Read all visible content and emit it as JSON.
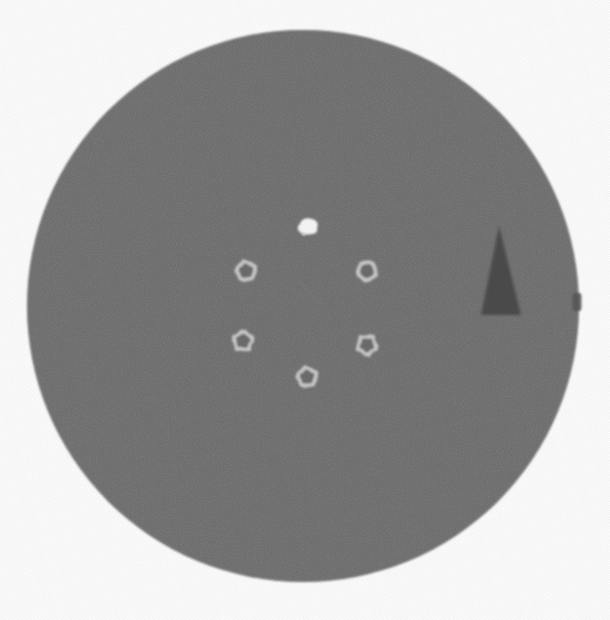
{
  "image": {
    "kind": "medical-scan-slice",
    "modality_hint": "axial-grayscale-slice",
    "width": 610,
    "height": 620,
    "background_color": "#fcfcfc",
    "caption": ""
  },
  "palette": {
    "background": "#fcfcfc",
    "phantom_body": "#6e6e6e",
    "phantom_edge": "#6a6a6a",
    "ring_bright": "#c9c9c9",
    "ring_core": "#6c6c6c",
    "blob_bright": "#f6f6f6",
    "wedge_dark": "#4b4b4b",
    "streak": "#7a7a7a",
    "edge_notch": "#555555"
  },
  "objects": {
    "phantom": {
      "name": "circular phantom body",
      "shape": "circle",
      "cx": 303,
      "cy": 306,
      "r": 276,
      "fill": "#6e6e6e"
    },
    "wedge": {
      "name": "dark triangular insert",
      "shape": "triangle",
      "apex_x": 499,
      "apex_y": 226,
      "base_left_x": 481,
      "base_right_x": 521,
      "base_y": 315,
      "fill": "#4b4b4b"
    },
    "blob": {
      "name": "bright irregular focus",
      "shape": "irregular-blob",
      "cx": 308,
      "cy": 227,
      "rx": 9,
      "ry": 7,
      "fill": "#f6f6f6"
    },
    "streak": {
      "name": "faint diagonal streak artifact",
      "x1": 296,
      "y1": 278,
      "x2": 326,
      "y2": 310,
      "stroke": "#7a7a7a"
    },
    "edge_notch": {
      "name": "edge marker notch",
      "cx": 576,
      "cy": 302,
      "w": 9,
      "h": 18,
      "fill": "#555555"
    }
  },
  "rings": [
    {
      "id": "ring-upper-left",
      "label": "upper left insert",
      "cx": 246,
      "cy": 271,
      "r_outer": 11,
      "r_inner": 7
    },
    {
      "id": "ring-upper-right",
      "label": "upper right insert",
      "cx": 367,
      "cy": 271,
      "r_outer": 11,
      "r_inner": 7
    },
    {
      "id": "ring-lower-left",
      "label": "lower left insert",
      "cx": 243,
      "cy": 341,
      "r_outer": 11,
      "r_inner": 7
    },
    {
      "id": "ring-lower-right",
      "label": "lower right insert",
      "cx": 367,
      "cy": 345,
      "r_outer": 11,
      "r_inner": 7
    },
    {
      "id": "ring-bottom-center",
      "label": "bottom center insert",
      "cx": 307,
      "cy": 377,
      "r_outer": 11,
      "r_inner": 7
    },
    {
      "id": "ring-top-center",
      "label": "top center insert",
      "cx": 308,
      "cy": 227,
      "r_outer": 0,
      "r_inner": 0
    }
  ]
}
